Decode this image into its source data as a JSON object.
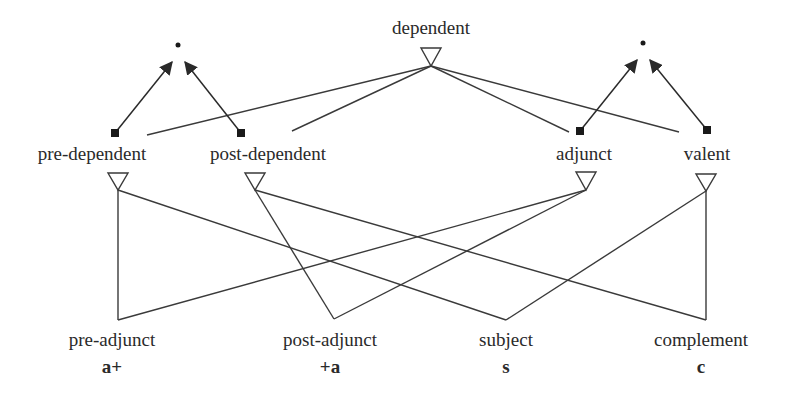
{
  "diagram": {
    "nodes": {
      "dependent": {
        "label": "dependent",
        "x": 431,
        "y": 18
      },
      "pre_dependent": {
        "label": "pre-dependent",
        "x": 92,
        "y": 144
      },
      "post_dependent": {
        "label": "post-dependent",
        "x": 268,
        "y": 144
      },
      "adjunct": {
        "label": "adjunct",
        "x": 584,
        "y": 144
      },
      "valent": {
        "label": "valent",
        "x": 707,
        "y": 144
      },
      "pre_adjunct": {
        "label": "pre-adjunct",
        "abbr": "a+",
        "x": 112,
        "y": 330
      },
      "post_adjunct": {
        "label": "post-adjunct",
        "abbr": "+a",
        "x": 330,
        "y": 330
      },
      "subject": {
        "label": "subject",
        "abbr": "s",
        "x": 506,
        "y": 330
      },
      "complement": {
        "label": "complement",
        "abbr": "c",
        "x": 701,
        "y": 330
      }
    },
    "dots": [
      {
        "name": "left-dot",
        "x": 178,
        "y": 45
      },
      {
        "name": "right-dot",
        "x": 643,
        "y": 43
      }
    ],
    "triangles": [
      {
        "name": "dependent-triangle",
        "x": 431,
        "top": 48,
        "apex": 66
      },
      {
        "name": "pre-dependent-triangle",
        "x": 118,
        "top": 173,
        "apex": 190
      },
      {
        "name": "post-dependent-triangle",
        "x": 255,
        "top": 173,
        "apex": 190
      },
      {
        "name": "adjunct-triangle",
        "x": 586,
        "top": 172,
        "apex": 190
      },
      {
        "name": "valent-triangle",
        "x": 706,
        "top": 174,
        "apex": 191
      }
    ],
    "squares": [
      {
        "name": "pre-dependent-square",
        "x": 115,
        "y": 133
      },
      {
        "name": "post-dependent-square",
        "x": 241,
        "y": 133
      },
      {
        "name": "adjunct-square",
        "x": 580,
        "y": 131
      },
      {
        "name": "valent-square",
        "x": 707,
        "y": 130
      }
    ],
    "edges_upper": [
      {
        "from": "dependent",
        "x1": 431,
        "y1": 66,
        "x2": 147,
        "y2": 135
      },
      {
        "from": "dependent",
        "x1": 431,
        "y1": 66,
        "x2": 292,
        "y2": 131
      },
      {
        "from": "dependent",
        "x1": 431,
        "y1": 66,
        "x2": 569,
        "y2": 132
      },
      {
        "from": "dependent",
        "x1": 431,
        "y1": 66,
        "x2": 679,
        "y2": 132
      }
    ],
    "arrows": [
      {
        "x1": 115,
        "y1": 133,
        "x2": 172,
        "y2": 62
      },
      {
        "x1": 241,
        "y1": 133,
        "x2": 185,
        "y2": 62
      },
      {
        "x1": 580,
        "y1": 131,
        "x2": 637,
        "y2": 60
      },
      {
        "x1": 707,
        "y1": 130,
        "x2": 650,
        "y2": 60
      }
    ],
    "edges_lower": [
      {
        "from": "pre-dependent",
        "to": "pre-adjunct",
        "x1": 118,
        "y1": 190,
        "x2": 118,
        "y2": 320
      },
      {
        "from": "pre-dependent",
        "to": "subject",
        "x1": 118,
        "y1": 190,
        "x2": 506,
        "y2": 320
      },
      {
        "from": "post-dependent",
        "to": "post-adjunct",
        "x1": 255,
        "y1": 190,
        "x2": 334,
        "y2": 319
      },
      {
        "from": "post-dependent",
        "to": "complement",
        "x1": 255,
        "y1": 190,
        "x2": 706,
        "y2": 320
      },
      {
        "from": "adjunct",
        "to": "pre-adjunct",
        "x1": 586,
        "y1": 190,
        "x2": 118,
        "y2": 320
      },
      {
        "from": "adjunct",
        "to": "post-adjunct",
        "x1": 586,
        "y1": 190,
        "x2": 334,
        "y2": 319
      },
      {
        "from": "valent",
        "to": "subject",
        "x1": 706,
        "y1": 191,
        "x2": 506,
        "y2": 320
      },
      {
        "from": "valent",
        "to": "complement",
        "x1": 706,
        "y1": 191,
        "x2": 706,
        "y2": 320
      }
    ],
    "colors": {
      "line": "#3a3a3a",
      "text": "#2a2a2a",
      "background": "#ffffff"
    }
  }
}
